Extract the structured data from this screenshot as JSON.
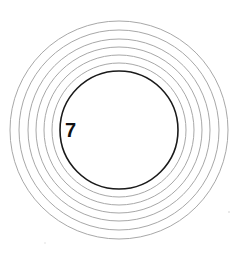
{
  "figure": {
    "label": "7",
    "center": {
      "x": 119,
      "y": 130
    },
    "main_circle": {
      "radius": 59,
      "color": "#1a1a1a",
      "stroke_width": 1.6
    },
    "rings": {
      "count": 6,
      "radii": [
        67,
        75,
        83,
        91,
        100,
        109
      ],
      "color": "#a8a8a8",
      "stroke_width": 1
    }
  }
}
